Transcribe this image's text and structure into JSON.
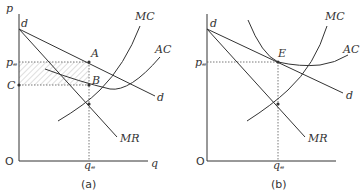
{
  "panels": [
    {
      "id": "a",
      "caption": "(a)",
      "y_axis_label": "p",
      "x_axis_label": "q",
      "origin_label": "O",
      "price_label": "pₑ",
      "cost_label": "C",
      "quantity_label": "qₑ",
      "point_labels": {
        "upper": "A",
        "lower": "B"
      },
      "curves": {
        "mc": "MC",
        "ac": "AC",
        "demand_top": "d",
        "demand_end": "d",
        "mr": "MR"
      }
    },
    {
      "id": "b",
      "caption": "(b)",
      "origin_label": "O",
      "price_label": "pₑ",
      "quantity_label": "qₑ",
      "point_labels": {
        "equilibrium": "E"
      },
      "curves": {
        "mc": "MC",
        "ac": "AC",
        "demand_top": "d",
        "demand_end": "d",
        "mr": "MR"
      }
    }
  ]
}
